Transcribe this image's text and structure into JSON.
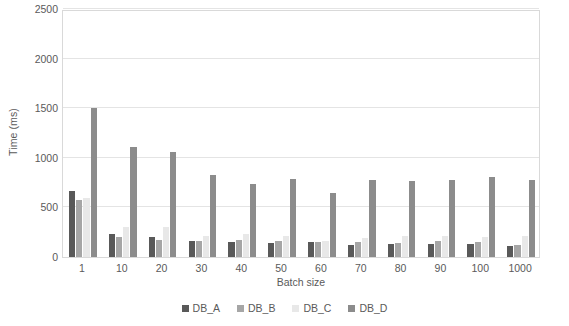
{
  "chart_data": {
    "type": "bar",
    "title": "",
    "subtitle": "",
    "xlabel": "Batch size",
    "ylabel": "Time (ms)",
    "ylim": [
      0,
      2500
    ],
    "yticks": [
      0,
      500,
      1000,
      1500,
      2000,
      2500
    ],
    "ytick_labels": [
      "0",
      "500",
      "1000",
      "1500",
      "2000",
      "2500"
    ],
    "grid": "horizontal",
    "legend_position": "bottom-center",
    "categories": [
      "1",
      "10",
      "20",
      "30",
      "40",
      "50",
      "60",
      "70",
      "80",
      "90",
      "100",
      "1000"
    ],
    "series": [
      {
        "name": "DB_A",
        "color": "#595959",
        "values": [
          670,
          235,
          205,
          160,
          155,
          140,
          150,
          125,
          130,
          130,
          135,
          115
        ]
      },
      {
        "name": "DB_B",
        "color": "#a6a6a6",
        "values": [
          570,
          205,
          175,
          160,
          175,
          165,
          150,
          155,
          145,
          160,
          155,
          120
        ]
      },
      {
        "name": "DB_C",
        "color": "#e8e8e8",
        "values": [
          590,
          300,
          300,
          215,
          235,
          210,
          165,
          190,
          215,
          210,
          200,
          215
        ]
      },
      {
        "name": "DB_D",
        "color": "#8c8c8c",
        "values": [
          1500,
          1110,
          1055,
          825,
          740,
          790,
          650,
          775,
          765,
          780,
          805,
          780
        ]
      }
    ]
  },
  "legend": {
    "items": [
      {
        "label": "DB_A",
        "color": "#595959"
      },
      {
        "label": "DB_B",
        "color": "#a6a6a6"
      },
      {
        "label": "DB_C",
        "color": "#e8e8e8"
      },
      {
        "label": "DB_D",
        "color": "#8c8c8c"
      }
    ]
  }
}
